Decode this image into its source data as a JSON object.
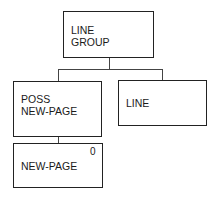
{
  "diagram": {
    "type": "tree",
    "nodes": [
      {
        "id": "line-group",
        "label": "LINE\nGROUP"
      },
      {
        "id": "poss-new-page",
        "label": "POSS\nNEW-PAGE",
        "parent": "line-group"
      },
      {
        "id": "line",
        "label": "LINE",
        "parent": "line-group"
      },
      {
        "id": "new-page",
        "label": "NEW-PAGE",
        "marker": "0",
        "parent": "poss-new-page"
      }
    ]
  }
}
